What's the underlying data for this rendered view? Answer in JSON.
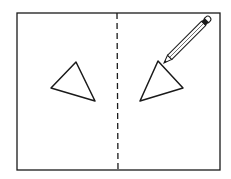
{
  "figure": {
    "colors": {
      "stroke": "#1a1a1a",
      "background": "#ffffff"
    },
    "frame": {
      "x": 17,
      "y": 13,
      "width": 203,
      "height": 158
    },
    "mirror_line": {
      "x": 117,
      "style": "dashed"
    },
    "left_triangle": [
      [
        51,
        88
      ],
      [
        76,
        62
      ],
      [
        95,
        101
      ]
    ],
    "right_triangle": [
      [
        140,
        101
      ],
      [
        158,
        61
      ],
      [
        183,
        88
      ]
    ],
    "pencil": {
      "tip": [
        164,
        62
      ],
      "end": [
        207,
        18
      ]
    }
  }
}
